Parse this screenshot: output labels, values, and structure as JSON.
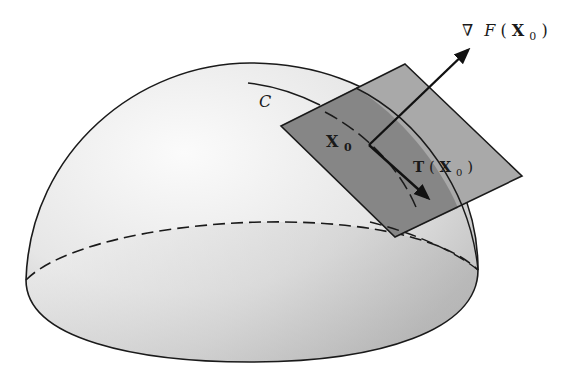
{
  "figure": {
    "title": "",
    "labels": {
      "gradient_nabla": "∇",
      "gradient_F": "F",
      "gradient_open": "(",
      "gradient_X": "X",
      "gradient_sub": "0",
      "gradient_close": ")",
      "curve": "C",
      "point_X": "X",
      "point_sub": "0",
      "tangent_T": "T",
      "tangent_open": "(",
      "tangent_X": "X",
      "tangent_sub": "0",
      "tangent_close": ")"
    },
    "colors": {
      "surface_light": "#f2f2f2",
      "surface_dark": "#b8b8b8",
      "plane_light": "#a8a8a8",
      "plane_dark": "#7a7a7a",
      "stroke": "#1a1a1a"
    }
  }
}
